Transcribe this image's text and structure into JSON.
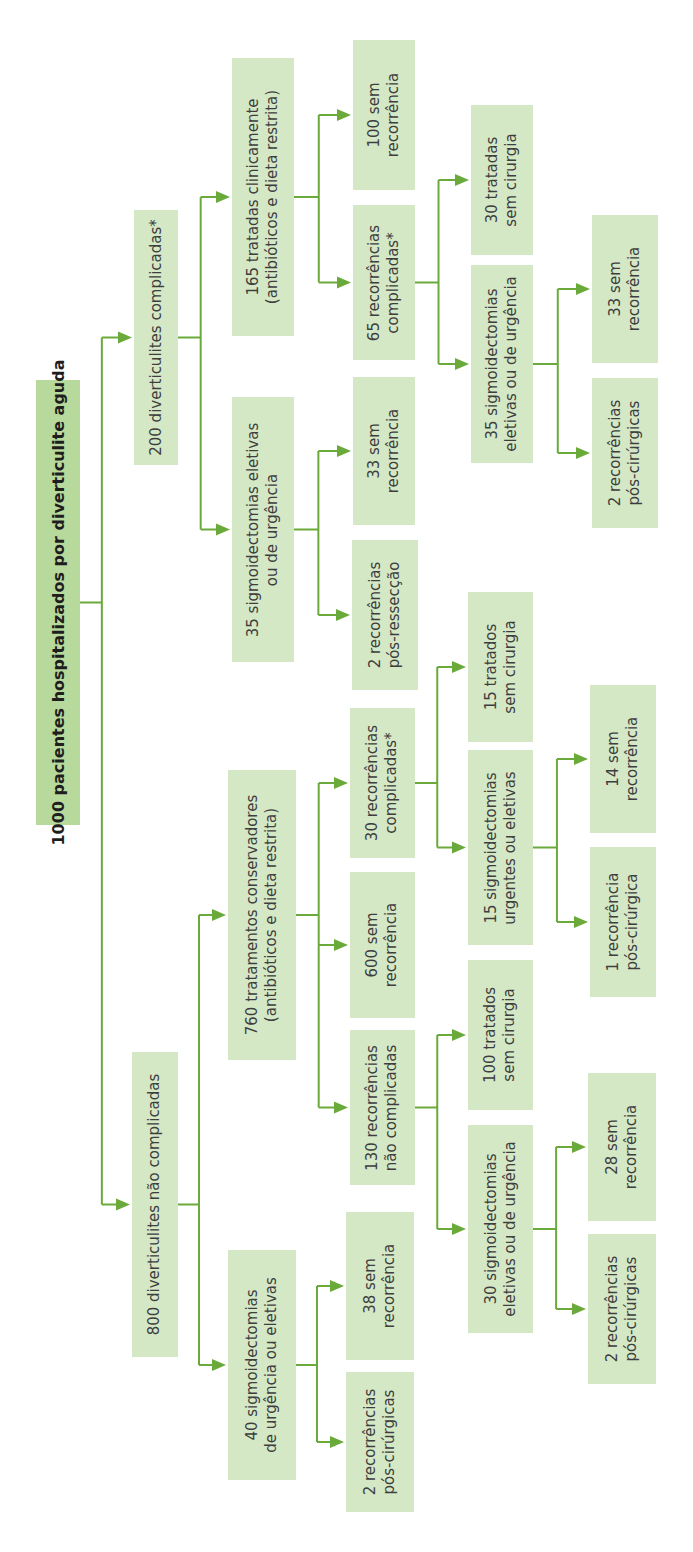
{
  "diagram": {
    "title": "1000 pacientes hospitalizados por diverticulite aguda",
    "colors": {
      "node_fill": "#d5e8c6",
      "root_fill": "#b7d99b",
      "connector": "#6aaa3a",
      "text": "#3e3e3e"
    },
    "nodes": {
      "root": "1000 pacientes hospitalizados por diverticulite aguda",
      "complicated": "200 diverticulites complicadas*",
      "uncomplicated": "800 diverticulites não complicadas",
      "c_clinical": "165 tratadas clinicamente\n(antibióticos e dieta restrita)",
      "c_surgery": "35 sigmoidectomias eletivas\nou de urgência",
      "u_conservative": "760 tratamentos conservadores\n(antibióticos e dieta restrita)",
      "u_surgery": "40 sigmoidectomias\nde urgência ou eletivas",
      "c_clin_norec": "100 sem\nrecorrência",
      "c_clin_rec": "65 recorrências\ncomplicadas*",
      "c_surg_norec": "33 sem\nrecorrência",
      "c_surg_rec": "2 recorrências\npós-ressecção",
      "u_cons_comp": "30 recorrências\ncomplicadas*",
      "u_cons_norec": "600 sem\nrecorrência",
      "u_cons_uncomp": "130 recorrências\nnão complicadas",
      "u_surg_norec": "38 sem\nrecorrência",
      "u_surg_rec": "2 recorrências\npós-cirúrgicas",
      "c65_nosurg": "30 tratadas\nsem cirurgia",
      "c65_surg": "35 sigmoidectomias\neletivas ou de urgência",
      "u30_nosurg": "15 tratados\nsem cirurgia",
      "u30_surg": "15 sigmoidectomias\nurgentes ou eletivas",
      "u130_nosurg": "100 tratados\nsem cirurgia",
      "u130_surg": "30 sigmoidectomias\neletivas ou de urgência",
      "c35_norec": "33 sem\nrecorrência",
      "c35_rec": "2 recorrências\npós-cirúrgicas",
      "u15_norec": "14 sem\nrecorrência",
      "u15_rec": "1 recorrência\npós-cirúrgica",
      "u30s_norec": "28 sem\nrecorrência",
      "u30s_rec": "2 recorrências\npós-cirúrgicas"
    }
  }
}
